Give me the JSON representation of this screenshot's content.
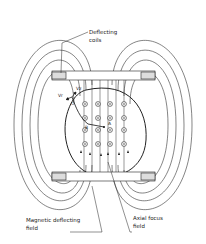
{
  "diagram": {
    "labels": {
      "deflecting_coils_1": "Deflecting",
      "deflecting_coils_2": "coils",
      "vr": "Vr",
      "vz": "Vz",
      "c": "C",
      "b": "B",
      "a": "A",
      "magnetic_field_1": "Magnetic deflecting",
      "magnetic_field_2": "field",
      "axial_field_1": "Axial focus",
      "axial_field_2": "field"
    },
    "colors": {
      "line": "#222222",
      "background": "#ffffff"
    }
  }
}
